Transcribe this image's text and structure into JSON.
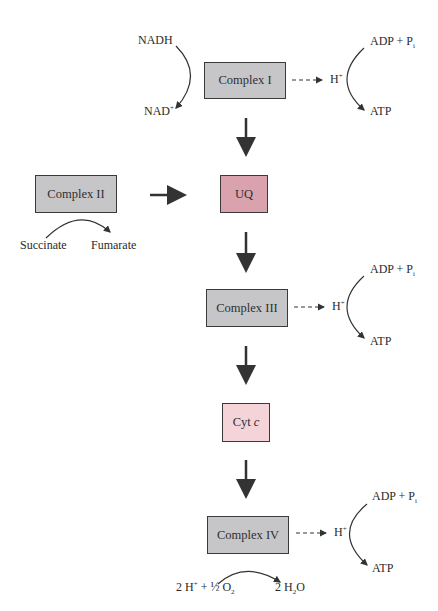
{
  "diagram": {
    "nodes": {
      "complex1": "Complex I",
      "complex2": "Complex II",
      "uq": "UQ",
      "complex3": "Complex III",
      "cytc_main": "Cyt ",
      "cytc_italic": "c",
      "complex4": "Complex IV"
    },
    "labels": {
      "nadh": "NADH",
      "nad_base": "NAD",
      "nad_sup": "+",
      "succinate": "Succinate",
      "fumarate": "Fumarate",
      "adp_base": "ADP + P",
      "adp_sub": "i",
      "atp": "ATP",
      "h_base": "H",
      "h_sup": "+",
      "water_left_1": "2 H",
      "water_left_sup": "+",
      "water_left_2": " + ",
      "half": "½",
      "o_base": " O",
      "o_sub": "2",
      "water_right_1": "2 H",
      "water_right_sub": "2",
      "water_right_2": "O"
    },
    "colors": {
      "complex_fill": "#c6c6c8",
      "uq_fill": "#d9a2ac",
      "cytc_fill": "#f4d3d9",
      "stroke": "#3a3a3a"
    }
  }
}
